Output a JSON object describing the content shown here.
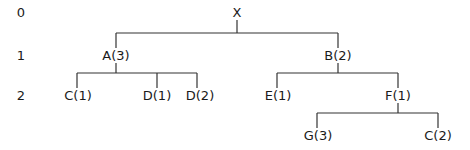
{
  "levels": [
    "0",
    "1",
    "2"
  ],
  "tree": {
    "root": "X",
    "level1": [
      "A(3)",
      "B(2)"
    ],
    "level2": [
      "C(1)",
      "D(1)",
      "D(2)",
      "E(1)",
      "F(1)"
    ],
    "level3": [
      "G(3)",
      "C(2)"
    ]
  },
  "edges": [
    [
      "X",
      "A(3)"
    ],
    [
      "X",
      "B(2)"
    ],
    [
      "A(3)",
      "C(1)"
    ],
    [
      "A(3)",
      "D(1)"
    ],
    [
      "A(3)",
      "D(2)"
    ],
    [
      "B(2)",
      "E(1)"
    ],
    [
      "B(2)",
      "F(1)"
    ],
    [
      "F(1)",
      "G(3)"
    ],
    [
      "F(1)",
      "C(2)"
    ]
  ],
  "colors": {
    "line": "#333333",
    "text": "#1a1a1a"
  }
}
